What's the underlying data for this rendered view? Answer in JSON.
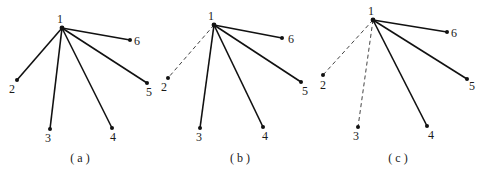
{
  "panels": [
    {
      "caption": "( a )",
      "nodes": [
        {
          "id": "1",
          "x": 62,
          "y": 28,
          "lx": 57,
          "ly": 23
        },
        {
          "id": "2",
          "x": 17,
          "y": 80,
          "lx": 9,
          "ly": 93
        },
        {
          "id": "3",
          "x": 50,
          "y": 129,
          "lx": 45,
          "ly": 142
        },
        {
          "id": "4",
          "x": 112,
          "y": 128,
          "lx": 110,
          "ly": 141
        },
        {
          "id": "5",
          "x": 147,
          "y": 83,
          "lx": 146,
          "ly": 96
        },
        {
          "id": "6",
          "x": 130,
          "y": 40,
          "lx": 134,
          "ly": 45
        }
      ],
      "edges": [
        {
          "from": "1",
          "to": "2",
          "style": "solid"
        },
        {
          "from": "1",
          "to": "3",
          "style": "solid"
        },
        {
          "from": "1",
          "to": "4",
          "style": "solid"
        },
        {
          "from": "1",
          "to": "5",
          "style": "solid"
        },
        {
          "from": "1",
          "to": "6",
          "style": "solid"
        }
      ],
      "caption_x": 80,
      "caption_y": 162
    },
    {
      "caption": "( b )",
      "nodes": [
        {
          "id": "1",
          "x": 214,
          "y": 25,
          "lx": 208,
          "ly": 20
        },
        {
          "id": "2",
          "x": 168,
          "y": 78,
          "lx": 161,
          "ly": 91
        },
        {
          "id": "3",
          "x": 200,
          "y": 128,
          "lx": 196,
          "ly": 141
        },
        {
          "id": "4",
          "x": 263,
          "y": 127,
          "lx": 262,
          "ly": 140
        },
        {
          "id": "5",
          "x": 301,
          "y": 82,
          "lx": 302,
          "ly": 95
        },
        {
          "id": "6",
          "x": 282,
          "y": 38,
          "lx": 288,
          "ly": 43
        }
      ],
      "edges": [
        {
          "from": "1",
          "to": "2",
          "style": "dashed"
        },
        {
          "from": "1",
          "to": "3",
          "style": "solid"
        },
        {
          "from": "1",
          "to": "4",
          "style": "solid"
        },
        {
          "from": "1",
          "to": "5",
          "style": "solid"
        },
        {
          "from": "1",
          "to": "6",
          "style": "solid"
        }
      ],
      "caption_x": 240,
      "caption_y": 162
    },
    {
      "caption": "( c )",
      "nodes": [
        {
          "id": "1",
          "x": 373,
          "y": 20,
          "lx": 368,
          "ly": 15
        },
        {
          "id": "2",
          "x": 323,
          "y": 75,
          "lx": 320,
          "ly": 89
        },
        {
          "id": "3",
          "x": 358,
          "y": 127,
          "lx": 353,
          "ly": 140
        },
        {
          "id": "4",
          "x": 427,
          "y": 126,
          "lx": 428,
          "ly": 139
        },
        {
          "id": "5",
          "x": 467,
          "y": 79,
          "lx": 469,
          "ly": 90
        },
        {
          "id": "6",
          "x": 447,
          "y": 32,
          "lx": 451,
          "ly": 37
        }
      ],
      "edges": [
        {
          "from": "1",
          "to": "2",
          "style": "dashed"
        },
        {
          "from": "1",
          "to": "3",
          "style": "dashed"
        },
        {
          "from": "1",
          "to": "4",
          "style": "solid"
        },
        {
          "from": "1",
          "to": "5",
          "style": "solid"
        },
        {
          "from": "1",
          "to": "6",
          "style": "solid"
        }
      ],
      "caption_x": 398,
      "caption_y": 162
    }
  ],
  "colors": {
    "edge": "#111111",
    "dashed_edge": "#444444",
    "node": "#111111",
    "background": "#ffffff"
  }
}
